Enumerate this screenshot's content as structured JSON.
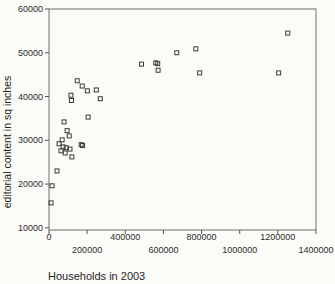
{
  "figure": {
    "xlabel": "Households in 2003",
    "ylabel": "editorial content in sq inches"
  },
  "colors": {
    "background": "#fbfbf8",
    "plot_border": "#6e6e6e",
    "tick_color": "#555555",
    "tick_text": "#2b2b2b",
    "marker_stroke": "#3a3a3a"
  },
  "chart_data": {
    "type": "scatter",
    "title": "",
    "xlabel": "Households in 2003",
    "ylabel": "editorial content in sq inches",
    "xlim": [
      0,
      1400000
    ],
    "ylim": [
      9500,
      60000
    ],
    "x_ticks": [
      0,
      200000,
      400000,
      600000,
      800000,
      1000000,
      1200000,
      1400000
    ],
    "x_tick_labels": [
      "0",
      "200000",
      "400000",
      "600000",
      "800000",
      "1000000",
      "1200000",
      "1400000"
    ],
    "x_tick_label_stagger": true,
    "y_ticks": [
      10000,
      20000,
      30000,
      40000,
      50000,
      60000
    ],
    "y_tick_labels": [
      "10000",
      "20000",
      "30000",
      "40000",
      "50000",
      "60000"
    ],
    "grid": false,
    "legend": null,
    "marker": "open-square",
    "marker_size_px": 4,
    "points": [
      [
        11000,
        15700
      ],
      [
        16000,
        19600
      ],
      [
        42000,
        23000
      ],
      [
        53000,
        29200
      ],
      [
        63000,
        27600
      ],
      [
        69000,
        30100
      ],
      [
        74000,
        28500
      ],
      [
        79000,
        34200
      ],
      [
        85000,
        27100
      ],
      [
        90000,
        28300
      ],
      [
        95000,
        32200
      ],
      [
        106000,
        31000
      ],
      [
        110000,
        28000
      ],
      [
        115000,
        40300
      ],
      [
        118000,
        39100
      ],
      [
        120000,
        26200
      ],
      [
        148000,
        43600
      ],
      [
        169000,
        29000
      ],
      [
        176000,
        28800
      ],
      [
        174000,
        42400
      ],
      [
        201000,
        41300
      ],
      [
        205000,
        35300
      ],
      [
        248000,
        41500
      ],
      [
        269000,
        39500
      ],
      [
        485000,
        47400
      ],
      [
        560000,
        47700
      ],
      [
        570000,
        47500
      ],
      [
        572000,
        46000
      ],
      [
        670000,
        50000
      ],
      [
        770000,
        50900
      ],
      [
        790000,
        45400
      ],
      [
        1204000,
        45400
      ],
      [
        1252000,
        54500
      ]
    ]
  }
}
